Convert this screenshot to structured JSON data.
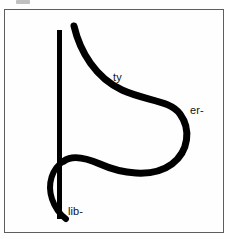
{
  "figure": {
    "kind": "scanned-letterform-diagram",
    "background_color": "#fefefe",
    "ink_color": "#000000",
    "frame": {
      "border_color": "#5e5e5e",
      "border_width_px": 1,
      "x": 4,
      "y": 9,
      "width": 220,
      "height": 224
    },
    "artifact": {
      "name": "top-edge-scan-artifact",
      "color": "#8d8d8d"
    },
    "labels": [
      {
        "id": "ty",
        "text": "ty",
        "x": 113,
        "y": 72
      },
      {
        "id": "er",
        "text": "er-",
        "x": 190,
        "y": 105
      },
      {
        "id": "lib",
        "text": "lib-",
        "x": 68,
        "y": 206
      }
    ],
    "strokes": {
      "stem": {
        "name": "vertical-stem",
        "x": 59.5,
        "y_top": 30,
        "y_bottom": 219,
        "width": 5
      },
      "bowl": {
        "name": "upper-bowl-curve",
        "start": [
          74,
          26
        ],
        "path": "M 74 26 C 80 52, 96 78, 122 90 C 146 101, 170 100, 180 114 C 191 129, 189 151, 172 164 C 152 179, 120 173, 100 164 C 84 157, 72 155, 64 161"
      },
      "loop": {
        "name": "lower-left-loop",
        "path": "M 64 161 C 52 168, 47 184, 52 199 C 56 211, 62 216, 66 219"
      },
      "stroke_width_px": 7
    }
  }
}
